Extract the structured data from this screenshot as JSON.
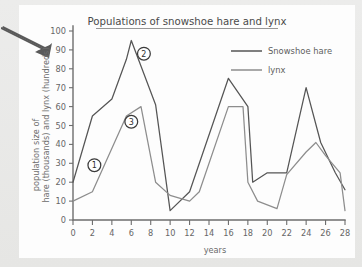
{
  "canvas": {
    "background_color": "#e9e9e7",
    "card_color": "#fdfdfd"
  },
  "annotation_arrow": {
    "name": "pointer-arrow",
    "color": "#5a5a5a",
    "direction": "right-down"
  },
  "chart_data": {
    "type": "line",
    "title": "Populations of snowshoe hare and lynx",
    "xlabel": "years",
    "ylabel": "population size of hare (thousands) and lynx (hundreds)",
    "ylabel_lines": [
      "population size of",
      "hare (thousands) and lynx (hundreds)"
    ],
    "xlim": [
      0,
      28
    ],
    "ylim": [
      0,
      100
    ],
    "xticks": [
      0,
      2,
      4,
      6,
      8,
      10,
      12,
      14,
      16,
      18,
      20,
      22,
      24,
      26,
      28
    ],
    "yticks": [
      0,
      10,
      20,
      30,
      40,
      50,
      60,
      70,
      80,
      90,
      100
    ],
    "grid": false,
    "legend_position": "top-right",
    "series": [
      {
        "name": "Snowshoe hare",
        "color": "#555555",
        "x": [
          0,
          2,
          4,
          5.5,
          6,
          8.5,
          10,
          12,
          16,
          18,
          18.5,
          20,
          22,
          24,
          25.5,
          27,
          28
        ],
        "values": [
          20,
          55,
          64,
          85,
          95,
          61,
          5,
          15,
          75,
          60,
          20,
          25,
          25,
          70,
          41,
          25,
          16
        ]
      },
      {
        "name": "lynx",
        "color": "#8d8d8d",
        "x": [
          0,
          2,
          5.5,
          7,
          8.5,
          10,
          12,
          13,
          16,
          17.5,
          18,
          19,
          21,
          22,
          24,
          25,
          26,
          27.5,
          28
        ],
        "values": [
          10,
          15,
          55,
          60,
          20,
          13,
          10,
          15,
          60,
          60,
          20,
          10,
          6,
          24,
          36,
          41,
          34,
          25,
          5
        ]
      }
    ],
    "annotations": [
      {
        "label": "1",
        "x": 2.2,
        "y": 29
      },
      {
        "label": "2",
        "x": 7.3,
        "y": 88
      },
      {
        "label": "3",
        "x": 6.0,
        "y": 52
      }
    ]
  },
  "legend": {
    "items": [
      {
        "label": "Snowshoe hare",
        "color": "#555555"
      },
      {
        "label": "lynx",
        "color": "#8d8d8d"
      }
    ]
  }
}
